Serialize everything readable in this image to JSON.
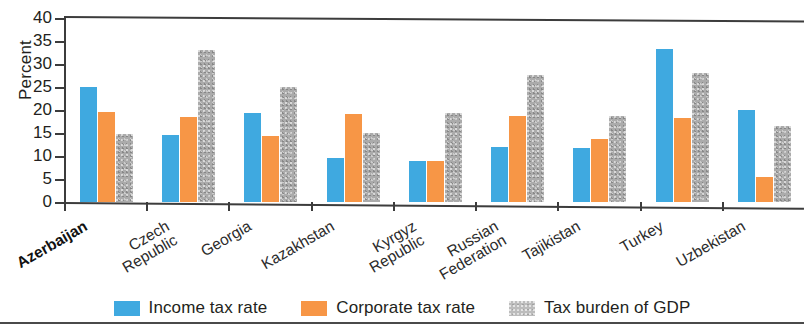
{
  "chart_data": {
    "type": "bar",
    "title": "",
    "xlabel": "",
    "ylabel": "Percent",
    "ylim": [
      0,
      40
    ],
    "yticks": [
      0,
      5,
      10,
      15,
      20,
      25,
      30,
      35,
      40
    ],
    "grid": false,
    "legend_position": "bottom",
    "categories": [
      "Azerbaijan",
      "Czech\nRepublic",
      "Georgia",
      "Kazakhstan",
      "Kyrgyz\nRepublic",
      "Russian\nFederation",
      "Tajikistan",
      "Turkey",
      "Uzbekistan"
    ],
    "series": [
      {
        "name": "Income tax rate",
        "color": "#3fa9e0",
        "values": [
          25.0,
          14.5,
          19.3,
          9.5,
          9.0,
          12.0,
          11.7,
          33.3,
          20.0
        ]
      },
      {
        "name": "Corporate tax rate",
        "color": "#f79646",
        "values": [
          19.5,
          18.5,
          14.3,
          19.2,
          9.0,
          18.7,
          13.7,
          18.2,
          5.5
        ]
      },
      {
        "name": "Tax burden of GDP",
        "color": "#ababab",
        "values": [
          14.8,
          33.0,
          25.0,
          15.0,
          19.3,
          27.7,
          18.8,
          28.0,
          16.5
        ]
      }
    ],
    "emphasized_category": "Azerbaijan"
  },
  "legend": {
    "items": [
      {
        "label": "Income tax rate",
        "swatch": "income"
      },
      {
        "label": "Corporate tax rate",
        "swatch": "corporate"
      },
      {
        "label": "Tax burden of GDP",
        "swatch": "burden"
      }
    ]
  }
}
